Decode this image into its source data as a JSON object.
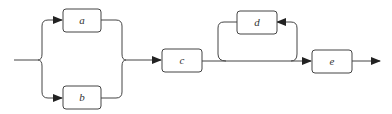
{
  "diagram": {
    "type": "flow",
    "stroke_color": "#333333",
    "nodes": [
      {
        "id": "a",
        "label": "a"
      },
      {
        "id": "b",
        "label": "b"
      },
      {
        "id": "c",
        "label": "c"
      },
      {
        "id": "d",
        "label": "d"
      },
      {
        "id": "e",
        "label": "e"
      }
    ],
    "edges": [
      {
        "from": "input",
        "to": "a",
        "kind": "parallel-split"
      },
      {
        "from": "input",
        "to": "b",
        "kind": "parallel-split"
      },
      {
        "from": "a",
        "to": "c",
        "kind": "join"
      },
      {
        "from": "b",
        "to": "c",
        "kind": "join"
      },
      {
        "from": "c",
        "to": "e",
        "kind": "sequence"
      },
      {
        "from": "c",
        "to": "d",
        "kind": "loop"
      },
      {
        "from": "e",
        "to": "output",
        "kind": "sequence"
      }
    ]
  }
}
